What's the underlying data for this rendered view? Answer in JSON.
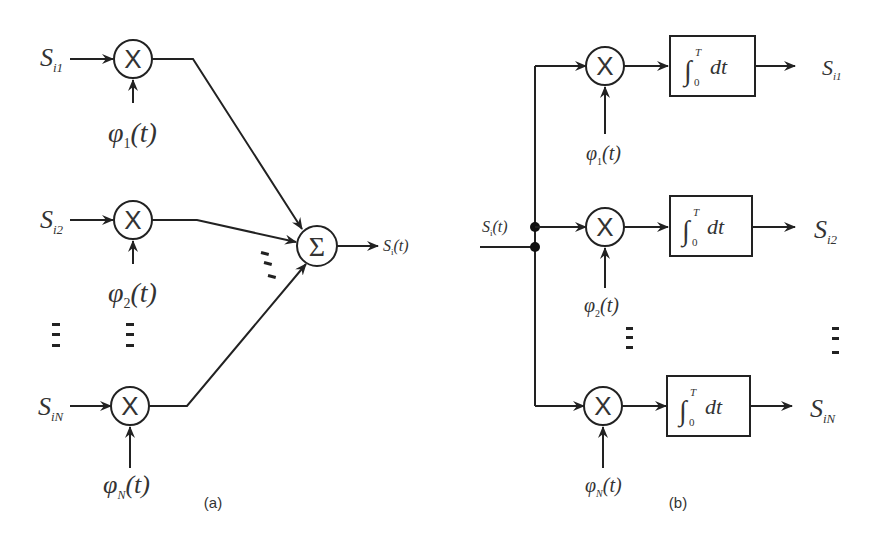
{
  "figure": {
    "panel_a": {
      "caption": "(a)",
      "inputs": [
        {
          "sym": "S",
          "sub": "i1"
        },
        {
          "sym": "S",
          "sub": "i2"
        },
        {
          "sym": "S",
          "sub": "iN"
        }
      ],
      "basis": [
        {
          "sym": "φ",
          "sub": "1",
          "arg": "(t)"
        },
        {
          "sym": "φ",
          "sub": "2",
          "arg": "(t)"
        },
        {
          "sym": "φ",
          "sub": "N",
          "arg": "(t)"
        }
      ],
      "multiplier_symbol": "X",
      "summer_symbol": "Σ",
      "output": {
        "sym": "S",
        "sub": "i",
        "arg": "(t)"
      }
    },
    "panel_b": {
      "caption": "(b)",
      "input": {
        "sym": "S",
        "sub": "i",
        "arg": "(t)"
      },
      "basis": [
        {
          "sym": "φ",
          "sub": "1",
          "arg": "(t)"
        },
        {
          "sym": "φ",
          "sub": "2",
          "arg": "(t)"
        },
        {
          "sym": "φ",
          "sub": "N",
          "arg": "(t)"
        }
      ],
      "multiplier_symbol": "X",
      "integrator": {
        "sign": "∫",
        "lower": "0",
        "upper": "T",
        "body": "dt"
      },
      "outputs": [
        {
          "sym": "S",
          "sub": "i1"
        },
        {
          "sym": "S",
          "sub": "i2"
        },
        {
          "sym": "S",
          "sub": "iN"
        }
      ]
    }
  }
}
